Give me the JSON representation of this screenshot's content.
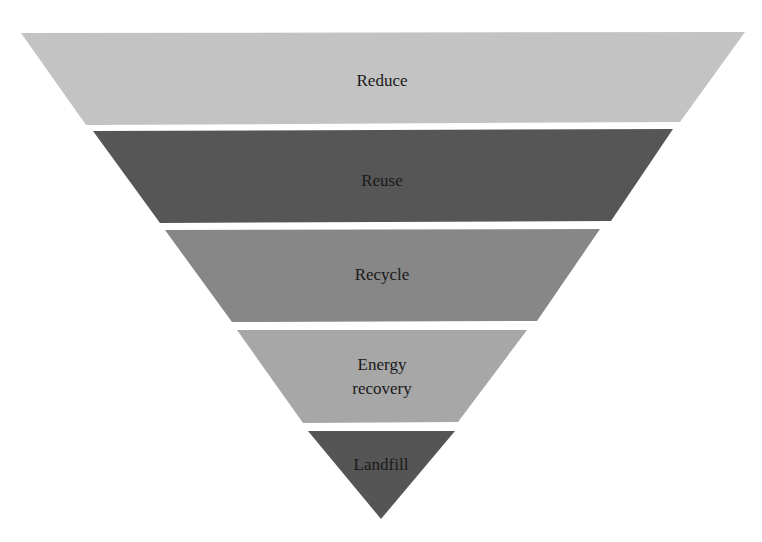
{
  "diagram": {
    "type": "inverted-pyramid",
    "title": "",
    "levels": [
      {
        "label": "Reduce",
        "lines": [
          "Reduce"
        ],
        "color": "#c3c3c3",
        "polygon": "21,33 745,32 680,122 86,125",
        "text_x": 382,
        "text_y": [
          86
        ]
      },
      {
        "label": "Reuse",
        "lines": [
          "Reuse"
        ],
        "color": "#565656",
        "polygon": "93,131 673,129 611,221 160,223",
        "text_x": 382,
        "text_y": [
          186
        ]
      },
      {
        "label": "Recycle",
        "lines": [
          "Recycle"
        ],
        "color": "#878787",
        "polygon": "165,230 600,229 537,321 232,322",
        "text_x": 382,
        "text_y": [
          280
        ]
      },
      {
        "label": "Energy recovery",
        "lines": [
          "Energy",
          "recovery"
        ],
        "color": "#a7a7a7",
        "polygon": "237,330 527,330 458,422 303,423",
        "text_x": 382,
        "text_y": [
          370,
          394
        ]
      },
      {
        "label": "Landfill",
        "lines": [
          "Landfill"
        ],
        "color": "#555555",
        "polygon": "308,431 455,431 381,519",
        "text_x": 381,
        "text_y": [
          470
        ]
      }
    ]
  }
}
